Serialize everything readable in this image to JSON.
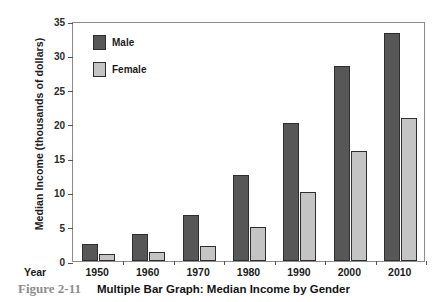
{
  "chart_data": {
    "type": "bar",
    "title": "Multiple Bar Graph: Median Income by Gender",
    "xlabel": "Year",
    "ylabel": "Median Income (thousands of dollars)",
    "categories": [
      "1950",
      "1960",
      "1970",
      "1980",
      "1990",
      "2000",
      "2010"
    ],
    "series": [
      {
        "name": "Male",
        "color": "#575757",
        "values": [
          2.5,
          4.0,
          6.7,
          12.5,
          20.2,
          28.4,
          33.2
        ]
      },
      {
        "name": "Female",
        "color": "#c4c4c4",
        "values": [
          1.0,
          1.3,
          2.2,
          5.0,
          10.0,
          16.0,
          20.8
        ]
      }
    ],
    "ylim": [
      0,
      35
    ],
    "yticks": [
      "0",
      "5",
      "10",
      "15",
      "20",
      "25",
      "30",
      "35"
    ],
    "grid": false,
    "legend_position": "top-left-inside"
  },
  "caption": {
    "number": "Figure 2-11",
    "title": "Multiple Bar Graph: Median Income by Gender"
  }
}
